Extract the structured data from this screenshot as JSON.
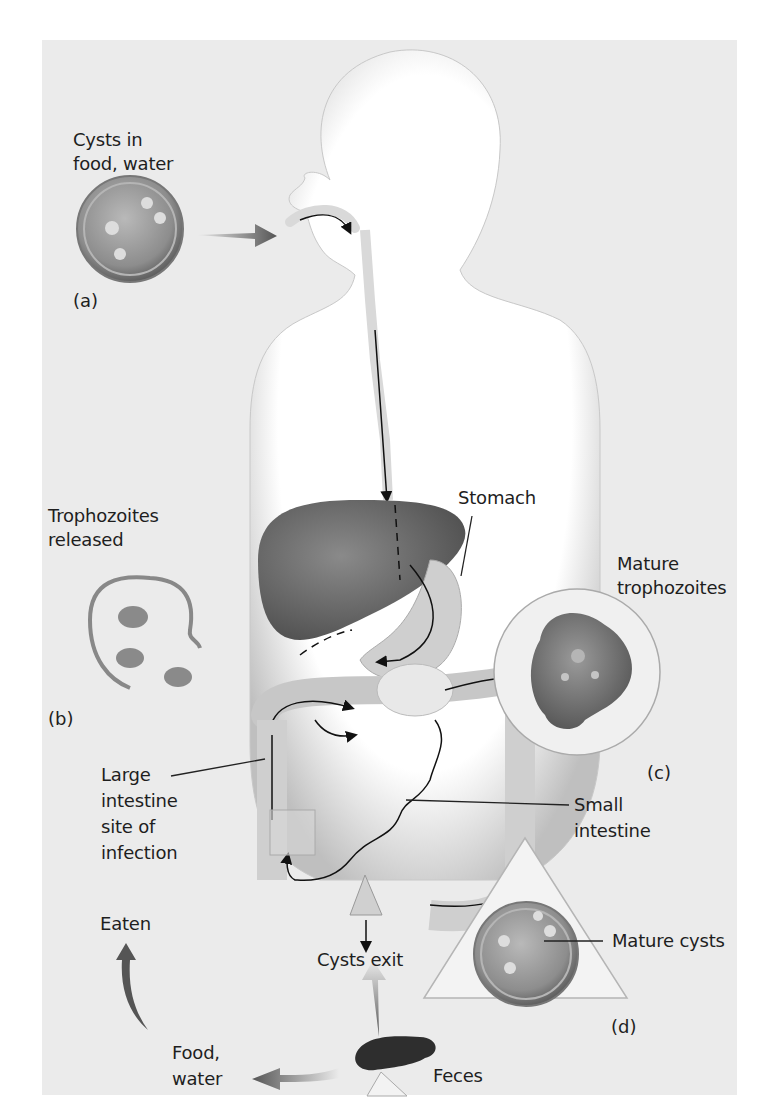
{
  "diagram": {
    "labels": {
      "cysts_in_food_water": [
        "Cysts in",
        "food, water"
      ],
      "trophozoites_released": [
        "Trophozoites",
        "released"
      ],
      "stomach": "Stomach",
      "mature_trophozoites": [
        "Mature",
        "trophozoites"
      ],
      "large_intestine": [
        "Large",
        "intestine",
        "site of",
        "infection"
      ],
      "small_intestine": [
        "Small",
        "intestine"
      ],
      "eaten": "Eaten",
      "cysts_exit": "Cysts exit",
      "mature_cysts": "Mature cysts",
      "food_water": [
        "Food,",
        "water"
      ],
      "feces": "Feces"
    },
    "panel_tags": {
      "a": "(a)",
      "b": "(b)",
      "c": "(c)",
      "d": "(d)"
    },
    "colors": {
      "background": "#ebebeb",
      "body_silhouette": "#ffffff",
      "organ_dark": "#6e6e6e",
      "arrow": "#555555",
      "text": "#1e1e1e"
    }
  }
}
